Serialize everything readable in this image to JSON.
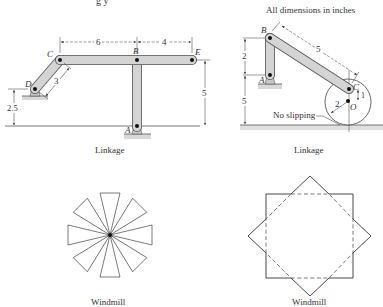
{
  "header": {
    "cropped_top_text": "g y",
    "note": "All dimensions in inches"
  },
  "figures": [
    {
      "id": "linkage-left",
      "caption": "Linkage",
      "points": {
        "A": "A",
        "B": "B",
        "C": "C",
        "D": "D",
        "E": "E"
      },
      "dimensions": {
        "CB": "6",
        "BE": "4",
        "E_height": "5",
        "CD": "3",
        "D_height": "2.5"
      }
    },
    {
      "id": "linkage-right",
      "caption": "Linkage",
      "points": {
        "A": "A",
        "B": "B",
        "C": "C",
        "O": "O"
      },
      "dimensions": {
        "AB": "2",
        "A_height": "5",
        "BC": "5",
        "CO": "1",
        "radius": "2"
      },
      "annotation": "No slipping"
    },
    {
      "id": "windmill-left",
      "caption": "Windmill",
      "blade_count": 8
    },
    {
      "id": "windmill-right",
      "caption": "Windmill",
      "shapes": [
        "square",
        "rotated-square"
      ]
    }
  ],
  "colors": {
    "bar_fill": "#d4d4d4",
    "bar_stroke": "#555555",
    "line": "#333333",
    "ground": "#e0e0e0"
  }
}
